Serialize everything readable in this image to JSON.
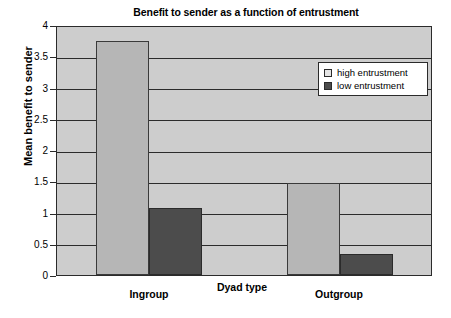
{
  "chart_data": {
    "type": "bar",
    "title": "Benefit to sender as a function of entrustment",
    "xlabel": "Dyad type",
    "ylabel": "Mean benefit to sender",
    "categories": [
      "Ingroup",
      "Outgroup"
    ],
    "series": [
      {
        "name": "high entrustment",
        "values": [
          3.75,
          1.47
        ],
        "color": "#b6b6b6"
      },
      {
        "name": "low entrustment",
        "values": [
          1.08,
          0.34
        ],
        "color": "#4c4c4c"
      }
    ],
    "ylim": [
      0,
      4
    ],
    "yticks": [
      "0",
      "0.5",
      "1",
      "1.5",
      "2",
      "2.5",
      "3",
      "3.5",
      "4"
    ],
    "ytick_values": [
      0,
      0.5,
      1,
      1.5,
      2,
      2.5,
      3,
      3.5,
      4
    ],
    "grid": true,
    "legend_position": "upper right",
    "plot_background": "#cdcdcd",
    "axis_color": "#2b2b2b"
  }
}
